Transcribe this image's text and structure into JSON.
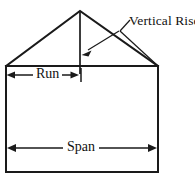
{
  "diagram": {
    "type": "line-drawing",
    "canvas": {
      "width": 195,
      "height": 177,
      "background": "#ffffff"
    },
    "ink_color": "#1a1a1a",
    "labels": {
      "vertical_rise": "Vertical Rise",
      "run": "Run",
      "span": "Span"
    },
    "geometry": {
      "wall_left_x": 6,
      "wall_right_x": 158,
      "eave_y": 66,
      "base_y": 172,
      "apex_x": 80,
      "apex_y": 11,
      "center_line_bottom_y": 75,
      "run_dimension_y": 75,
      "span_dimension_y": 148,
      "leader_elbow": [
        120,
        31
      ],
      "arrow_tip": [
        82,
        55
      ]
    },
    "elements": [
      {
        "name": "building-outline",
        "shape": "rectangle"
      },
      {
        "name": "roof-gable",
        "shape": "triangle"
      },
      {
        "name": "vertical-rise-line",
        "shape": "line"
      },
      {
        "name": "run-dimension",
        "shape": "double-arrow"
      },
      {
        "name": "span-dimension",
        "shape": "double-arrow"
      },
      {
        "name": "vertical-rise-leader",
        "shape": "arrow"
      }
    ]
  }
}
